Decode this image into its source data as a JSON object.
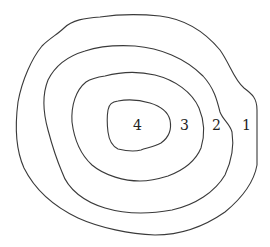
{
  "diagram": {
    "type": "contour-map",
    "stroke_color": "#3a3a3a",
    "background": "#ffffff",
    "contours": [
      {
        "level": "1",
        "label_pos": [
          246,
          130
        ],
        "path": "M100,17 C120,14 140,14 160,16 C185,19 205,32 220,50 C230,64 234,80 244,88 C252,94 257,98 257,110 L257,165 C254,182 242,198 225,212 C205,226 180,235 155,235 C130,234 100,228 78,218 C55,207 35,190 24,168 C15,148 15,125 18,102 C22,80 32,58 42,46 C50,38 58,34 64,28 C72,20 85,18 100,17 Z"
      },
      {
        "level": "2",
        "label_pos": [
          216,
          130
        ],
        "path": "M85,51 C100,46 118,45 135,46 C160,48 185,58 203,76 C214,88 217,100 220,112 C223,120 230,124 232,132 C234,145 232,160 225,175 C215,192 195,205 172,210 C150,214 125,214 105,208 C85,202 68,190 62,172 C56,158 52,145 48,130 C43,112 42,95 48,80 C55,66 68,56 85,51 Z"
      },
      {
        "level": "3",
        "label_pos": [
          184,
          130
        ],
        "path": "M105,76 C120,72 138,71 155,75 C175,80 192,92 199,108 C204,120 205,135 201,148 C196,160 184,170 168,176 C155,180 146,181 140,181 C125,181 105,176 92,165 C80,154 74,138 72,122 C71,105 76,90 86,82 C92,78 98,77 105,76 Z"
      },
      {
        "level": "4",
        "label_pos": [
          137,
          130
        ],
        "path": "M118,101 C128,99 140,100 150,103 C160,106 168,112 170,120 C172,130 168,138 161,143 C154,147 146,148 141,150 C134,152 126,151 118,149 C112,146 109,140 108,132 C107,124 107,116 108,110 C109,104 112,102 118,101 Z"
      }
    ]
  },
  "labels": {
    "l1": "1",
    "l2": "2",
    "l3": "3",
    "l4": "4"
  }
}
